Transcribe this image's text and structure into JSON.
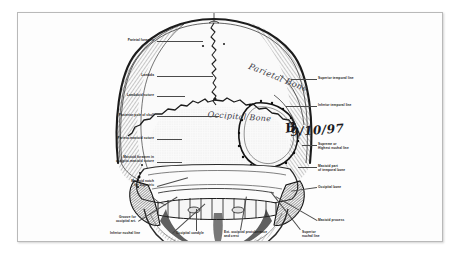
{
  "document": {
    "type": "anatomical-illustration",
    "subject": "Human skull, posterior (occipital) view",
    "title": ""
  },
  "handwriting": {
    "parietal_bone": "Parietal Bone",
    "occipital_bone": "Occipital Bone",
    "date": "9/10/97",
    "mark": "B"
  },
  "labels_left": [
    {
      "id": "parietal-foramen",
      "text": "Parietal foramen"
    },
    {
      "id": "lambda",
      "text": "Lambda"
    },
    {
      "id": "lambdoid-suture",
      "text": "Lambdoid suture"
    },
    {
      "id": "posterior-pole",
      "text": "Posterior pole of skull"
    },
    {
      "id": "parieto-mastoid-suture",
      "text": "Parieto-mastoid suture"
    },
    {
      "id": "mastoid-foramen",
      "text": "Mastoid foramen in\noccipito-mastoid suture"
    },
    {
      "id": "mastoid-notch",
      "text": "Mastoid notch\nfor Digastric"
    }
  ],
  "labels_bottom": [
    {
      "id": "groove-occipital-artery",
      "text": "Groove for\noccipital art."
    },
    {
      "id": "inferior-nuchal-line",
      "text": "Inferior nuchal line"
    },
    {
      "id": "occipital-condyle",
      "text": "Occipital condyle"
    },
    {
      "id": "ext-occipital-protuberance",
      "text": "Ext. occipital protuberance\nand crest"
    },
    {
      "id": "superior-nuchal-line",
      "text": "Superior\nnuchal line"
    }
  ],
  "labels_right": [
    {
      "id": "superior-temporal-line",
      "text": "Superior temporal line"
    },
    {
      "id": "inferior-temporal-line",
      "text": "Inferior temporal line"
    },
    {
      "id": "supreme-nuchal-line",
      "text": "Supreme or\nHighest nuchal line"
    },
    {
      "id": "mastoid-part-temporal",
      "text": "Mastoid part\nof temporal bone"
    },
    {
      "id": "occipital-bone",
      "text": "Occipital bone"
    },
    {
      "id": "mastoid-process",
      "text": "Mastoid process"
    }
  ],
  "colors": {
    "page_background": "#ffffff",
    "plate_background": "#fdfdfd",
    "frame_border": "#b9b9b9",
    "ink": "#1b1b1b",
    "leader_line": "#4a4a4a",
    "handwriting": "#3a3a46"
  }
}
